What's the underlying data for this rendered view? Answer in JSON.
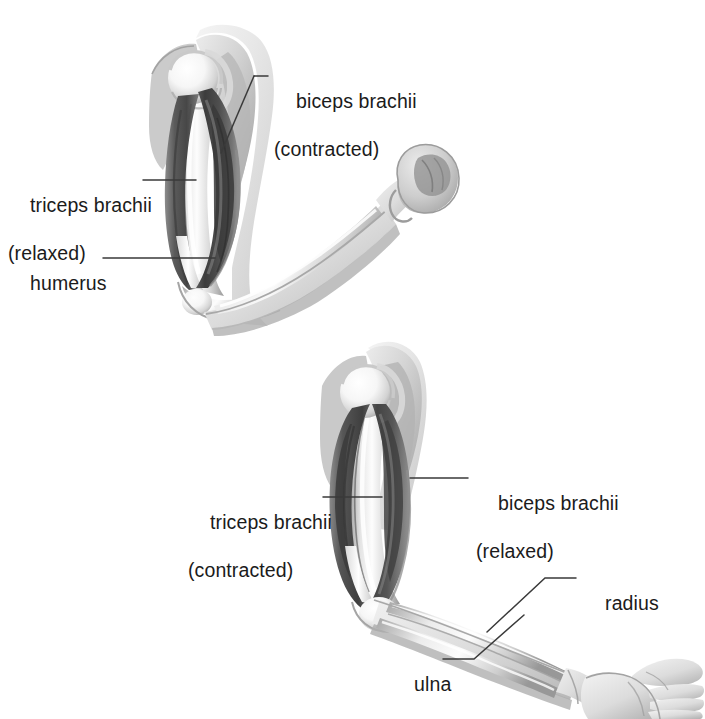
{
  "figure": {
    "background_color": "#ffffff",
    "ink_color": "#1b1b1b",
    "leader_line_color": "#3a3a3a",
    "panels": [
      {
        "name": "flexed-arm",
        "position": "top",
        "description": "Arm flexed at the elbow with a clenched fist, biceps brachii contracted and triceps brachii relaxed"
      },
      {
        "name": "extended-arm",
        "position": "bottom",
        "description": "Arm extended at the elbow with an open hand, triceps brachii contracted and biceps brachii relaxed"
      }
    ]
  },
  "labels": {
    "top_biceps": {
      "line1": "biceps brachii",
      "line2": "(contracted)"
    },
    "top_triceps": {
      "line1": "triceps brachii",
      "line2": "(relaxed)"
    },
    "top_humerus": {
      "line1": "humerus",
      "line2": ""
    },
    "bottom_triceps": {
      "line1": "triceps brachii",
      "line2": "(contracted)"
    },
    "bottom_biceps": {
      "line1": "biceps brachii",
      "line2": "(relaxed)"
    },
    "bottom_radius": {
      "line1": "radius",
      "line2": ""
    },
    "bottom_ulna": {
      "line1": "ulna",
      "line2": ""
    }
  },
  "palette": {
    "skin_light": "#f2f2f2",
    "skin_mid": "#d8d8d8",
    "skin_shadow": "#b4b4b4",
    "bone_highlight": "#fbfbfb",
    "bone_mid": "#dedede",
    "bone_shadow": "#a8a8a8",
    "muscle_light": "#9a9a9a",
    "muscle_mid": "#6f6f6f",
    "muscle_dark": "#4a4a4a",
    "muscle_deep": "#343434",
    "outline": "#8e8e8e"
  }
}
